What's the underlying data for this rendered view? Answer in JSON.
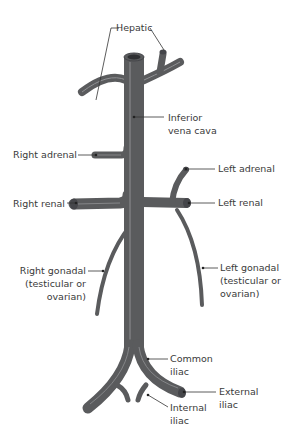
{
  "diagram": {
    "colors": {
      "vein": "#5a5b5d",
      "vein_dark": "#45464a",
      "highlight": "#8f9093",
      "label_text": "#3a3a3a",
      "leader_line": "#333333",
      "background": "#ffffff"
    },
    "labels": {
      "hepatic": "Hepatic",
      "ivc_1": "Inferior",
      "ivc_2": "vena cava",
      "right_adrenal": "Right adrenal",
      "left_adrenal": "Left adrenal",
      "right_renal": "Right renal",
      "left_renal": "Left renal",
      "right_gonadal_1": "Right gonadal",
      "right_gonadal_2": "(testicular or",
      "right_gonadal_3": "ovarian)",
      "left_gonadal_1": "Left gonadal",
      "left_gonadal_2": "(testicular or",
      "left_gonadal_3": "ovarian)",
      "common_iliac_1": "Common",
      "common_iliac_2": "iliac",
      "external_iliac_1": "External",
      "external_iliac_2": "iliac",
      "internal_iliac_1": "Internal",
      "internal_iliac_2": "iliac"
    }
  }
}
